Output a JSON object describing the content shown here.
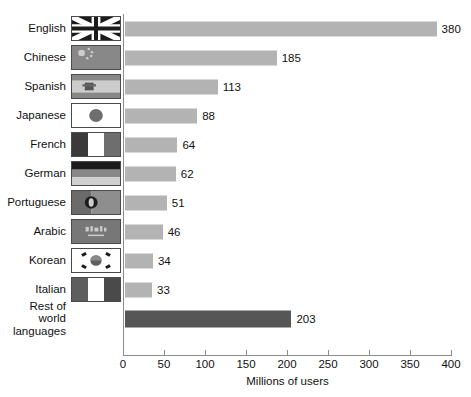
{
  "chart_data": {
    "type": "bar",
    "orientation": "horizontal",
    "title": "",
    "xlabel": "Millions of users",
    "ylabel": "",
    "xlim": [
      0,
      400
    ],
    "xticks": [
      0,
      50,
      100,
      150,
      200,
      250,
      300,
      350,
      400
    ],
    "grid": false,
    "legend": false,
    "categories": [
      "English",
      "Chinese",
      "Spanish",
      "Japanese",
      "French",
      "German",
      "Portuguese",
      "Arabic",
      "Korean",
      "Italian",
      "Rest of world\nlanguages"
    ],
    "values": [
      380,
      185,
      113,
      88,
      64,
      62,
      51,
      46,
      34,
      33,
      203
    ],
    "value_labels": [
      "380",
      "185",
      "113",
      "88",
      "64",
      "62",
      "51",
      "46",
      "34",
      "33",
      "203"
    ],
    "flags": [
      "union-jack-flag-icon",
      "china-flag-icon",
      "spain-flag-icon",
      "japan-flag-icon",
      "france-flag-icon",
      "germany-flag-icon",
      "portugal-flag-icon",
      "saudi-arabia-flag-icon",
      "south-korea-flag-icon",
      "italy-flag-icon",
      "no-flag"
    ],
    "colors": {
      "bar": "#b3b3b3",
      "bar_highlight": "#565656",
      "axis": "#8c8c8c",
      "text": "#111111",
      "background": "#ffffff"
    },
    "highlight_index": 10
  }
}
